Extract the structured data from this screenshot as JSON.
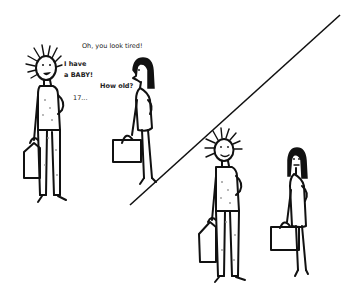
{
  "comic": {
    "panels": [
      {
        "id": "panel-top-left",
        "dialogue": [
          {
            "speaker": "woman",
            "text": "Oh, you look tired!"
          },
          {
            "speaker": "man",
            "line1": "I have",
            "line2": "a BABY!"
          },
          {
            "speaker": "woman",
            "text": "How old?"
          },
          {
            "speaker": "man",
            "text": "17..."
          }
        ]
      },
      {
        "id": "panel-bottom-right",
        "dialogue": []
      }
    ],
    "colors": {
      "ink": "#111111",
      "background": "#ffffff",
      "speckle": "#9a9a9a"
    }
  }
}
